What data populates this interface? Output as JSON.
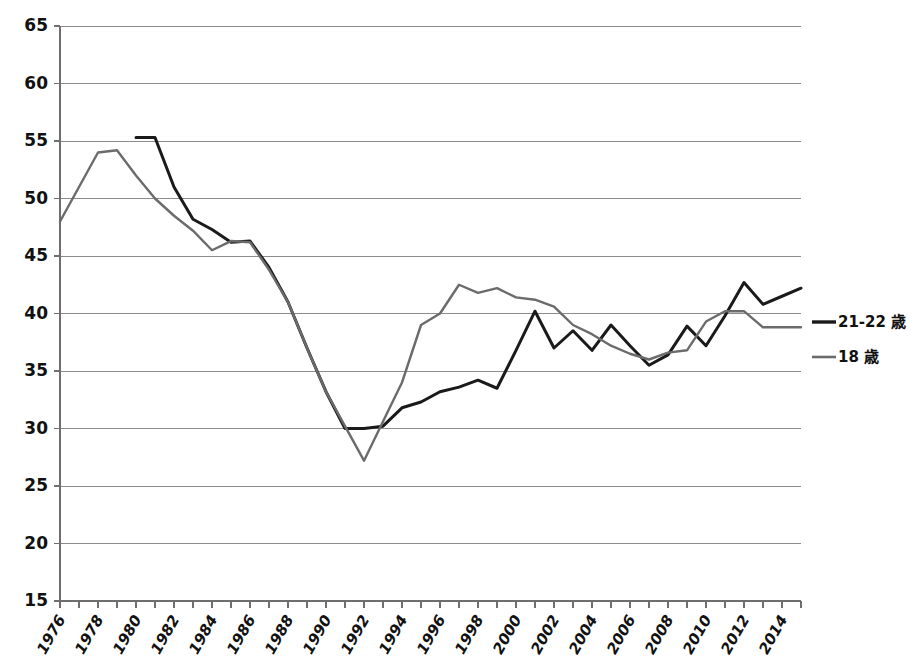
{
  "chart_data": {
    "type": "line",
    "title": "",
    "subtitle": "",
    "xlabel": "",
    "ylabel": "",
    "xlim": [
      1976,
      2015
    ],
    "ylim": [
      15,
      65
    ],
    "ytick_step": 5,
    "xtick_label_step": 2,
    "grid": "horizontal",
    "legend_position": "right",
    "y_ticks": [
      15,
      20,
      25,
      30,
      35,
      40,
      45,
      50,
      55,
      60,
      65
    ],
    "x_ticks": [
      1976,
      1977,
      1978,
      1979,
      1980,
      1981,
      1982,
      1983,
      1984,
      1985,
      1986,
      1987,
      1988,
      1989,
      1990,
      1991,
      1992,
      1993,
      1994,
      1995,
      1996,
      1997,
      1998,
      1999,
      2000,
      2001,
      2002,
      2003,
      2004,
      2005,
      2006,
      2007,
      2008,
      2009,
      2010,
      2011,
      2012,
      2013,
      2014,
      2015
    ],
    "x_tick_labels": [
      "1976",
      "1978",
      "1980",
      "1982",
      "1984",
      "1986",
      "1988",
      "1990",
      "1992",
      "1994",
      "1996",
      "1998",
      "2000",
      "2002",
      "2004",
      "2006",
      "2008",
      "2010",
      "2012",
      "2014"
    ],
    "x_tick_label_years": [
      1976,
      1978,
      1980,
      1982,
      1984,
      1986,
      1988,
      1990,
      1992,
      1994,
      1996,
      1998,
      2000,
      2002,
      2004,
      2006,
      2008,
      2010,
      2012,
      2014
    ],
    "series": [
      {
        "name": "21-22 歳",
        "color": "#1a1a1a",
        "stroke_width": 3.0,
        "x": [
          1980,
          1981,
          1982,
          1983,
          1984,
          1985,
          1986,
          1987,
          1988,
          1989,
          1990,
          1991,
          1992,
          1993,
          1994,
          1995,
          1996,
          1997,
          1998,
          1999,
          2000,
          2001,
          2002,
          2003,
          2004,
          2005,
          2006,
          2007,
          2008,
          2009,
          2010,
          2011,
          2012,
          2013,
          2014,
          2015
        ],
        "values": [
          55.3,
          55.3,
          51.0,
          48.2,
          47.3,
          46.2,
          46.3,
          44.0,
          41.0,
          37.0,
          33.2,
          30.0,
          30.0,
          30.2,
          31.8,
          32.3,
          33.2,
          33.6,
          34.2,
          33.5,
          36.8,
          40.2,
          37.0,
          38.5,
          36.8,
          39.0,
          37.2,
          35.5,
          36.4,
          38.9,
          37.2,
          39.8,
          42.7,
          40.8,
          41.5,
          42.2
        ]
      },
      {
        "name": "18 歳",
        "color": "#6b6b6b",
        "stroke_width": 2.4,
        "x": [
          1976,
          1977,
          1978,
          1979,
          1980,
          1981,
          1982,
          1983,
          1984,
          1985,
          1986,
          1987,
          1988,
          1989,
          1990,
          1991,
          1992,
          1993,
          1994,
          1995,
          1996,
          1997,
          1998,
          1999,
          2000,
          2001,
          2002,
          2003,
          2004,
          2005,
          2006,
          2007,
          2008,
          2009,
          2010,
          2011,
          2012,
          2013,
          2014,
          2015
        ],
        "values": [
          48.0,
          51.0,
          54.0,
          54.2,
          52.0,
          50.0,
          48.5,
          47.2,
          45.5,
          46.3,
          46.2,
          43.8,
          41.0,
          37.0,
          33.2,
          30.2,
          27.2,
          30.6,
          34.0,
          39.0,
          40.0,
          42.5,
          41.8,
          42.2,
          41.4,
          41.2,
          40.6,
          39.0,
          38.2,
          37.2,
          36.5,
          36.0,
          36.6,
          36.8,
          39.3,
          40.2,
          40.2,
          38.8,
          38.8,
          38.8
        ]
      }
    ]
  },
  "legend": {
    "entries": [
      {
        "label": "21-22 歳",
        "swatch_color": "#1a1a1a"
      },
      {
        "label": "18 歳",
        "swatch_color": "#6b6b6b"
      }
    ]
  },
  "colors": {
    "background": "#ffffff",
    "gridline": "#8c8c8c",
    "axis": "#6e6e6e",
    "text": "#111111",
    "series_black": "#1a1a1a",
    "series_gray": "#6b6b6b"
  }
}
